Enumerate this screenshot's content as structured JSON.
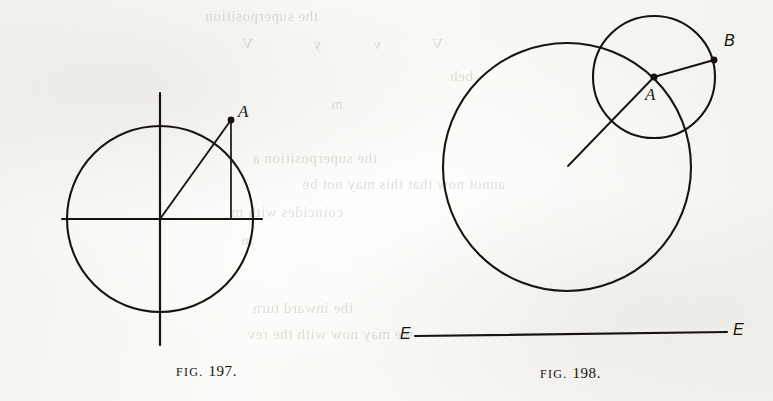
{
  "page": {
    "background_color": "#f8f8f6",
    "ink_color": "#18150f",
    "width": 773,
    "height": 401
  },
  "showthrough_text": {
    "note": "faint mirrored bleed-through from the reverse side of the leaf",
    "lines": [
      {
        "text": "the superposition",
        "x": 455,
        "y": 8
      },
      {
        "text": "V",
        "x": 330,
        "y": 36
      },
      {
        "text": "v",
        "x": 392,
        "y": 36
      },
      {
        "text": "y",
        "x": 452,
        "y": 36
      },
      {
        "text": "V",
        "x": 520,
        "y": 36
      },
      {
        "text": "beh",
        "x": 300,
        "y": 68
      },
      {
        "text": "m",
        "x": 430,
        "y": 96
      },
      {
        "text": "the superposition a",
        "x": 396,
        "y": 150
      },
      {
        "text": "annot now that this may not be",
        "x": 268,
        "y": 176
      },
      {
        "text": "coincides with m",
        "x": 430,
        "y": 204
      },
      {
        "text": "m",
        "x": 520,
        "y": 232
      },
      {
        "text": "the inward turn",
        "x": 420,
        "y": 300
      },
      {
        "text": "we may now with the rev",
        "x": 360,
        "y": 326
      }
    ]
  },
  "figures": [
    {
      "id": "fig-197",
      "caption_prefix": "FIG.",
      "caption_number": "197.",
      "caption_x": 176,
      "caption_y": 364,
      "circle": {
        "cx": 160,
        "cy": 219,
        "r": 93
      },
      "horizontal_diameter": {
        "x1": 62,
        "y1": 219,
        "x2": 262,
        "y2": 219
      },
      "vertical_diameter": {
        "x1": 160,
        "y1": 93,
        "x2": 160,
        "y2": 345
      },
      "points": [
        {
          "label": "A",
          "x": 231,
          "y": 120,
          "label_x": 238,
          "label_y": 103
        }
      ],
      "radius_to_a": {
        "x1": 160,
        "y1": 219,
        "x2": 231,
        "y2": 120
      },
      "perpendicular_from_a": {
        "x1": 231,
        "y1": 120,
        "x2": 231,
        "y2": 219
      }
    },
    {
      "id": "fig-198",
      "caption_prefix": "FIG.",
      "caption_number": "198.",
      "caption_x": 540,
      "caption_y": 366,
      "large_circle": {
        "cx": 567,
        "cy": 167,
        "r": 124
      },
      "small_circle": {
        "cx": 654,
        "cy": 77,
        "r": 61
      },
      "points": [
        {
          "label": "A",
          "x": 654,
          "y": 77,
          "label_x": 645,
          "label_y": 86
        },
        {
          "label": "B",
          "x": 714,
          "y": 60,
          "label_x": 724,
          "label_y": 33
        }
      ],
      "line_through_centers": {
        "x1": 568,
        "y1": 166,
        "x2": 654,
        "y2": 77
      },
      "radius_a_to_b": {
        "x1": 654,
        "y1": 77,
        "x2": 714,
        "y2": 60
      },
      "baseline": {
        "x1": 415,
        "y1": 336,
        "x2": 727,
        "y2": 332,
        "left_label": "E",
        "right_label": "E",
        "left_label_x": 400,
        "left_label_y": 326,
        "right_label_x": 733,
        "right_label_y": 322
      }
    }
  ]
}
